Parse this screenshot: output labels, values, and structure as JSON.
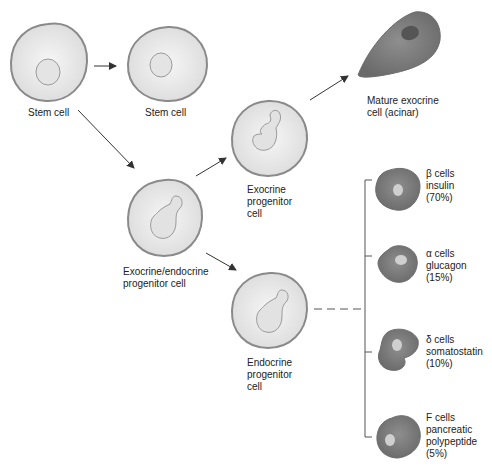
{
  "colors": {
    "cell_fill": "#e9e9e9",
    "cell_outline": "#8a8a8a",
    "mature_fill": "#7d7d7d",
    "arrow": "#333333"
  },
  "nodes": {
    "stem_cell_1": {
      "label": "Stem cell"
    },
    "stem_cell_2": {
      "label": "Stem cell"
    },
    "exo_endo_progenitor": {
      "line1": "Exocrine/endocrine",
      "line2": "progenitor cell"
    },
    "exocrine_progenitor": {
      "line1": "Exocrine",
      "line2": "progenitor",
      "line3": "cell"
    },
    "mature_exocrine": {
      "line1": "Mature exocrine",
      "line2": "cell (acinar)"
    },
    "endocrine_progenitor": {
      "line1": "Endocrine",
      "line2": "progenitor",
      "line3": "cell"
    }
  },
  "endocrine_cells": [
    {
      "type": "β cells",
      "hormone": "insulin",
      "percent": "(70%)"
    },
    {
      "type": "α cells",
      "hormone": "glucagon",
      "percent": "(15%)"
    },
    {
      "type": "δ cells",
      "hormone": "somatostatin",
      "percent": "(10%)"
    },
    {
      "type": "F cells",
      "hormone": "pancreatic",
      "hormone2": "polypeptide",
      "percent": "(5%)"
    }
  ]
}
